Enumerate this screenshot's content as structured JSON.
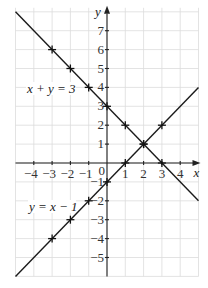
{
  "chart_data": {
    "type": "line",
    "title": "",
    "xlabel": "x",
    "ylabel": "y",
    "xlim": [
      -5,
      5
    ],
    "ylim": [
      -6,
      8
    ],
    "grid": true,
    "x_ticks": [
      -4,
      -3,
      -2,
      -1,
      1,
      2,
      3,
      4
    ],
    "y_ticks": [
      7,
      6,
      5,
      4,
      3,
      2,
      1,
      -1,
      -2,
      -3,
      -4,
      -5
    ],
    "origin_label": "0",
    "series": [
      {
        "name": "x + y = 3",
        "label": "x + y = 3",
        "points": [
          [
            -3,
            6
          ],
          [
            -2,
            5
          ],
          [
            -1,
            4
          ],
          [
            0,
            3
          ],
          [
            1,
            2
          ],
          [
            2,
            1
          ],
          [
            3,
            0
          ]
        ],
        "line_extent": [
          [
            -5,
            8
          ],
          [
            5,
            -2
          ]
        ]
      },
      {
        "name": "y = x − 1",
        "label": "y = x − 1",
        "points": [
          [
            -3,
            -4
          ],
          [
            -2,
            -3
          ],
          [
            -1,
            -2
          ],
          [
            0,
            -1
          ],
          [
            1,
            0
          ],
          [
            2,
            1
          ],
          [
            3,
            2
          ]
        ],
        "line_extent": [
          [
            -5,
            -6
          ],
          [
            5,
            4
          ]
        ]
      }
    ],
    "intersection": [
      2,
      1
    ]
  }
}
